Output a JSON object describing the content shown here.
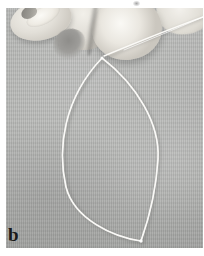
{
  "figure": {
    "panel_label": "b",
    "caption_text": "",
    "alt_description": "Hand pinching a thin metal wire bent into a pointed oval (lens-shaped) loop against a light grey fabric background",
    "background_color": "#b3b4b2",
    "wire_color": "#f2f1ec",
    "skin_color": "#e9e7e1",
    "label_color": "#1a1a1a",
    "panel_border_color": "#ffffff"
  },
  "photo": {
    "width_px": 197,
    "height_px": 240,
    "offset_x_px": 6,
    "offset_y_px": 8
  },
  "wire": {
    "loop_apex": {
      "x": 95,
      "y": 49
    },
    "loop_tip": {
      "x": 134,
      "y": 232
    },
    "left_extreme": {
      "x": 51,
      "y": 152
    },
    "right_extreme": {
      "x": 153,
      "y": 132
    },
    "free_end": {
      "x": 197,
      "y": 10
    },
    "stroke_width_px": 1.6
  },
  "hand": {
    "parts": [
      {
        "name": "index-finger"
      },
      {
        "name": "fingernail"
      },
      {
        "name": "middle-finger"
      },
      {
        "name": "thumb"
      },
      {
        "name": "far-right-finger"
      }
    ]
  }
}
